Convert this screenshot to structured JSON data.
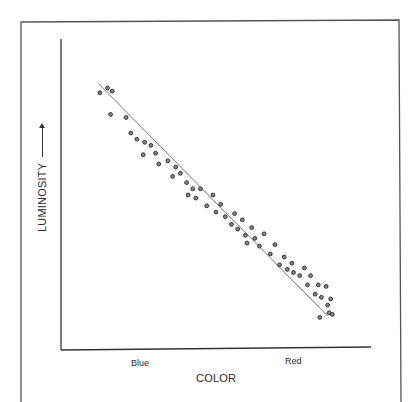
{
  "chart_data": {
    "type": "scatter",
    "title": "",
    "xlabel": "COLOR",
    "ylabel": "LUMINOSITY",
    "ylabel_arrow": "up-arrow",
    "x_tick_labels": [
      "Blue",
      "Red"
    ],
    "y_tick_labels": [],
    "xlim": [
      0,
      100
    ],
    "ylim": [
      0,
      100
    ],
    "grid": false,
    "legend": null,
    "trend_line": {
      "x": [
        12,
        86
      ],
      "y": [
        86,
        11
      ],
      "description": "linear fit, negative slope"
    },
    "points": [
      {
        "x": 12.5,
        "y": 83
      },
      {
        "x": 15,
        "y": 84.5
      },
      {
        "x": 16.5,
        "y": 83.5
      },
      {
        "x": 16,
        "y": 76
      },
      {
        "x": 21,
        "y": 75
      },
      {
        "x": 22.5,
        "y": 70
      },
      {
        "x": 24.5,
        "y": 68
      },
      {
        "x": 27,
        "y": 67
      },
      {
        "x": 26.5,
        "y": 63
      },
      {
        "x": 29,
        "y": 66
      },
      {
        "x": 30.5,
        "y": 63.5
      },
      {
        "x": 31.5,
        "y": 60
      },
      {
        "x": 34.5,
        "y": 61
      },
      {
        "x": 36,
        "y": 56
      },
      {
        "x": 37,
        "y": 59
      },
      {
        "x": 38.5,
        "y": 57
      },
      {
        "x": 40.5,
        "y": 54
      },
      {
        "x": 42.5,
        "y": 52
      },
      {
        "x": 41,
        "y": 50
      },
      {
        "x": 43.5,
        "y": 49
      },
      {
        "x": 45,
        "y": 52
      },
      {
        "x": 47,
        "y": 46.5
      },
      {
        "x": 49,
        "y": 50
      },
      {
        "x": 50,
        "y": 44.5
      },
      {
        "x": 51.5,
        "y": 47
      },
      {
        "x": 53,
        "y": 43
      },
      {
        "x": 55,
        "y": 40.5
      },
      {
        "x": 56,
        "y": 44
      },
      {
        "x": 57,
        "y": 39
      },
      {
        "x": 58.5,
        "y": 42
      },
      {
        "x": 59.5,
        "y": 37
      },
      {
        "x": 61.5,
        "y": 39.5
      },
      {
        "x": 60,
        "y": 34.5
      },
      {
        "x": 62.5,
        "y": 36
      },
      {
        "x": 64,
        "y": 33.5
      },
      {
        "x": 65.5,
        "y": 37.5
      },
      {
        "x": 67.5,
        "y": 31
      },
      {
        "x": 69,
        "y": 34
      },
      {
        "x": 70.5,
        "y": 27.5
      },
      {
        "x": 72,
        "y": 30
      },
      {
        "x": 73,
        "y": 26
      },
      {
        "x": 75,
        "y": 25
      },
      {
        "x": 74.5,
        "y": 28
      },
      {
        "x": 77,
        "y": 24
      },
      {
        "x": 78.5,
        "y": 26.5
      },
      {
        "x": 79.5,
        "y": 21
      },
      {
        "x": 80.5,
        "y": 24
      },
      {
        "x": 82,
        "y": 18
      },
      {
        "x": 83,
        "y": 21
      },
      {
        "x": 84,
        "y": 17
      },
      {
        "x": 85.5,
        "y": 20.5
      },
      {
        "x": 86,
        "y": 14.5
      },
      {
        "x": 87,
        "y": 16.5
      },
      {
        "x": 86.5,
        "y": 12
      },
      {
        "x": 87.5,
        "y": 11.5
      },
      {
        "x": 83.5,
        "y": 10.5
      }
    ]
  },
  "labels": {
    "xlabel": "COLOR",
    "ylabel": "LUMINOSITY",
    "tick_blue": "Blue",
    "tick_red": "Red"
  },
  "colors": {
    "ink": "#333333",
    "frame": "#555555",
    "background": "#ffffff"
  }
}
